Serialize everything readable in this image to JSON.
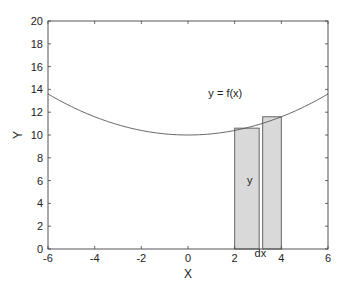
{
  "chart_data": {
    "type": "line",
    "title": "",
    "xlabel": "X",
    "ylabel": "Y",
    "xlim": [
      -6,
      6
    ],
    "ylim": [
      0,
      20
    ],
    "grid": false,
    "x_ticks": [
      -6,
      -4,
      -2,
      0,
      2,
      4,
      6
    ],
    "y_ticks": [
      0,
      2,
      4,
      6,
      8,
      10,
      12,
      14,
      16,
      18,
      20
    ],
    "series": [
      {
        "name": "y = f(x)",
        "function": "10 + 0.1*x^2",
        "x": [
          -6,
          -5,
          -4,
          -3,
          -2,
          -1,
          0,
          1,
          2,
          3,
          4,
          5,
          6
        ],
        "y": [
          13.6,
          12.5,
          11.6,
          10.9,
          10.4,
          10.1,
          10.0,
          10.1,
          10.4,
          10.9,
          11.6,
          12.5,
          13.6
        ]
      }
    ],
    "rectangles": [
      {
        "x0": 2.0,
        "x1": 3.05,
        "height": 10.6,
        "label": "y"
      },
      {
        "x0": 3.2,
        "x1": 4.0,
        "height": 11.6,
        "label": ""
      }
    ],
    "annotations": [
      {
        "text": "y = f(x)",
        "x": 1.6,
        "y": 13.3
      },
      {
        "text": "y",
        "x": 2.65,
        "y": 5.7
      },
      {
        "text": "dx",
        "x": 3.1,
        "y": -0.7
      }
    ],
    "colors": {
      "curve": "#555555",
      "rect_fill": "#d9d9d9",
      "rect_stroke": "#666666",
      "axes": "#444444"
    }
  }
}
